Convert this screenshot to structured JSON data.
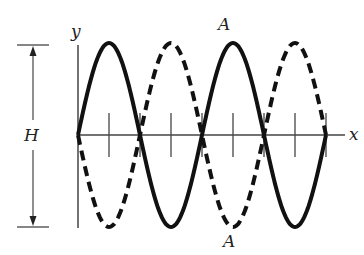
{
  "labels": {
    "y_axis": "y",
    "x_axis": "x",
    "height": "H",
    "antinode_top": "A",
    "antinode_bottom": "A"
  },
  "geometry": {
    "origin_x": 78,
    "axis_y": 135,
    "half_wavelength_px": 62,
    "amplitude_px": 92,
    "x_end": 340
  },
  "waves": [
    {
      "name": "solid-wave",
      "style": "solid",
      "phase": "positive"
    },
    {
      "name": "dashed-wave",
      "style": "dashed",
      "phase": "negative"
    }
  ],
  "colors": {
    "line": "#111111",
    "axis": "#444444"
  }
}
